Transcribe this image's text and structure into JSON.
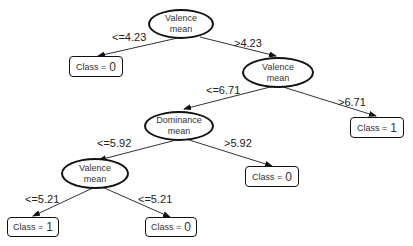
{
  "nodes": {
    "root": {
      "line1": "Valence",
      "line2": "mean"
    },
    "n2": {
      "line1": "Valence",
      "line2": "mean"
    },
    "n3": {
      "line1": "Dominance",
      "line2": "mean"
    },
    "n4": {
      "line1": "Valence",
      "line2": "mean"
    }
  },
  "leaves": {
    "l1": {
      "prefix": "Class =",
      "value": "0"
    },
    "l2": {
      "prefix": "Class =",
      "value": "1"
    },
    "l3": {
      "prefix": "Class =",
      "value": "0"
    },
    "l4": {
      "prefix": "Class =",
      "value": "1"
    },
    "l5": {
      "prefix": "Class =",
      "value": "0"
    }
  },
  "edges": {
    "root_left": "<=4.23",
    "root_right": ">4.23",
    "n2_left": "<=6.71",
    "n2_right": ">6.71",
    "n3_left": "<=5.92",
    "n3_right": ">5.92",
    "n4_left": "<=5.21",
    "n4_right": "<=5.21"
  }
}
